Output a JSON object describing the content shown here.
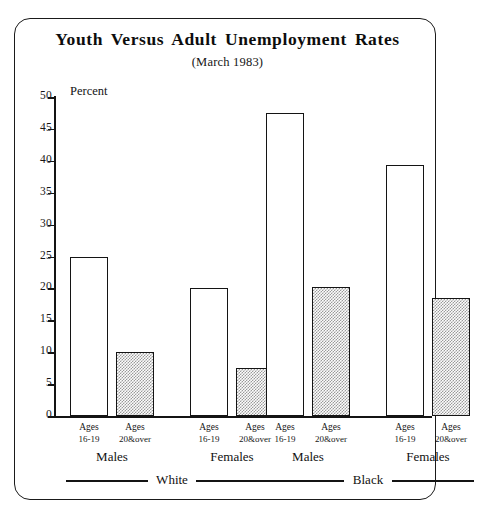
{
  "chart_data": {
    "type": "bar",
    "title": "Youth Versus Adult Unemployment Rates",
    "subtitle": "(March 1983)",
    "ylabel": "Percent",
    "xlabel": "",
    "ylim": [
      0,
      50
    ],
    "ytick_labels": [
      "0",
      "5",
      "10",
      "15",
      "20",
      "25",
      "30",
      "35",
      "40",
      "45",
      "50"
    ],
    "ytick_values": [
      0,
      5,
      10,
      15,
      20,
      25,
      30,
      35,
      40,
      45,
      50
    ],
    "grid": false,
    "legend_position": "none",
    "categories": [
      "White Males Ages 16-19",
      "White Males Ages 20&over",
      "White Females Ages 16-19",
      "White Females Ages 20&over",
      "Black Males Ages 16-19",
      "Black Males Ages 20&over",
      "Black Females Ages 16-19",
      "Black Females Ages 20&over"
    ],
    "values": [
      25.0,
      10.0,
      20.0,
      7.5,
      47.5,
      20.2,
      39.3,
      18.5
    ],
    "bars": [
      {
        "age_line1": "Ages",
        "age_line2": "16-19",
        "value": 25.0,
        "fill": "open"
      },
      {
        "age_line1": "Ages",
        "age_line2": "20&over",
        "value": 10.0,
        "fill": "dotted"
      },
      {
        "age_line1": "Ages",
        "age_line2": "16-19",
        "value": 20.0,
        "fill": "open"
      },
      {
        "age_line1": "Ages",
        "age_line2": "20&over",
        "value": 7.5,
        "fill": "dotted"
      },
      {
        "age_line1": "Ages",
        "age_line2": "16-19",
        "value": 47.5,
        "fill": "open"
      },
      {
        "age_line1": "Ages",
        "age_line2": "20&over",
        "value": 20.2,
        "fill": "dotted"
      },
      {
        "age_line1": "Ages",
        "age_line2": "16-19",
        "value": 39.3,
        "fill": "open"
      },
      {
        "age_line1": "Ages",
        "age_line2": "20&over",
        "value": 18.5,
        "fill": "dotted"
      }
    ],
    "sex_groups": [
      "Males",
      "Females",
      "Males",
      "Females"
    ],
    "race_groups": [
      "White",
      "Black"
    ],
    "colors": {
      "axis": "#141414",
      "bar_outline": "#141414",
      "bar_open_fill": "#ffffff",
      "bar_dotted_fill": "#d9d9d9",
      "text": "#111111",
      "frame": "#1a1a1a",
      "background": "#ffffff"
    }
  }
}
